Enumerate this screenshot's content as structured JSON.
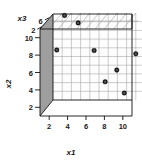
{
  "chart_data": {
    "type": "scatter",
    "title": "",
    "xlabel": "x1",
    "ylabel": "x2",
    "zlabel": "x3",
    "projection": "3d",
    "grid": true,
    "legend": "none",
    "xlim": [
      1,
      11
    ],
    "ylim": [
      1,
      11
    ],
    "zlim": [
      1,
      8
    ],
    "xticks": [
      "2",
      "4",
      "6",
      "8",
      "10"
    ],
    "yticks": [
      "2",
      "4",
      "6",
      "8",
      "10"
    ],
    "zticks": [
      "2",
      "6"
    ],
    "points": [
      {
        "x1": 2.4,
        "x2": 10.9,
        "x3": 7.3
      },
      {
        "x1": 4.3,
        "x2": 10.6,
        "x3": 5.2
      },
      {
        "x1": 2.6,
        "x2": 8.3,
        "x3": 2.1
      },
      {
        "x1": 6.4,
        "x2": 7.9,
        "x3": 3.4
      },
      {
        "x1": 10.6,
        "x2": 7.1,
        "x3": 5.0
      },
      {
        "x1": 8.9,
        "x2": 5.7,
        "x3": 3.2
      },
      {
        "x1": 7.9,
        "x2": 4.7,
        "x3": 1.9
      },
      {
        "x1": 9.9,
        "x2": 3.3,
        "x3": 2.3
      }
    ],
    "marker": {
      "shape": "circle",
      "fill": "#555555",
      "edge": "#111111",
      "size": 4.6
    }
  },
  "axes": {
    "x1": {
      "title": "x1",
      "ticks": [
        "2",
        "4",
        "6",
        "8",
        "10"
      ]
    },
    "x2": {
      "title": "x2",
      "ticks": [
        "10",
        "8",
        "6",
        "4",
        "2"
      ]
    },
    "x3": {
      "title": "x3",
      "ticks": [
        "2",
        "6"
      ]
    }
  },
  "colors": {
    "background": "#ffffff",
    "left_wall": "#9a9a9a",
    "ceiling": "#b5b5b5",
    "floor": "#ffffff",
    "grid_line": "#8d8d8d",
    "box_edge": "#1a1a1a",
    "point_fill": "#4f4f4f",
    "point_edge": "#111111"
  }
}
